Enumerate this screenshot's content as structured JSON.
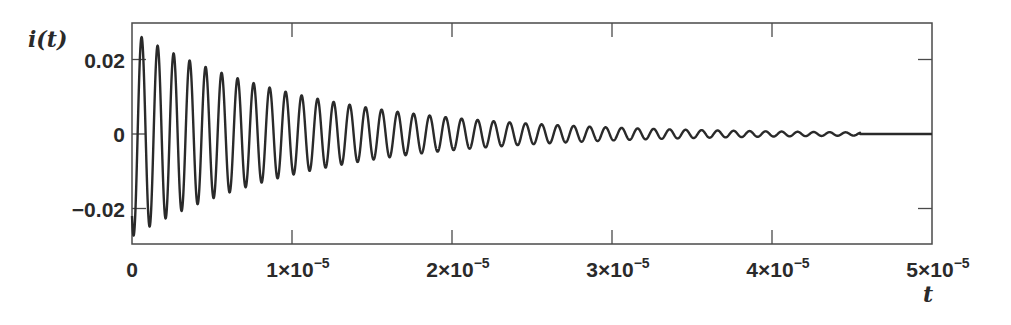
{
  "chart_data": {
    "type": "line",
    "title": "",
    "xlabel": "t",
    "ylabel": "i(t)",
    "xlim": [
      0,
      5e-05
    ],
    "ylim": [
      -0.03,
      0.03
    ],
    "grid": false,
    "legend": null,
    "x_ticks": [
      {
        "value": 0,
        "label": "0"
      },
      {
        "value": 1e-05,
        "label": "1×10",
        "exp": "−5"
      },
      {
        "value": 2e-05,
        "label": "2×10",
        "exp": "−5"
      },
      {
        "value": 3e-05,
        "label": "3×10",
        "exp": "−5"
      },
      {
        "value": 4e-05,
        "label": "4×10",
        "exp": "−5"
      },
      {
        "value": 5e-05,
        "label": "5×10",
        "exp": "−5"
      }
    ],
    "y_ticks": [
      {
        "value": 0.02,
        "label": "0.02"
      },
      {
        "value": 0,
        "label": "0"
      },
      {
        "value": -0.02,
        "label": "−0.02"
      }
    ],
    "series": [
      {
        "name": "i(t)",
        "description": "Underdamped decaying sinusoid (~1 MHz), amplitude decays from ~0.028 to ~0 by t≈4.55e-5, then flat at 0",
        "model": {
          "amplitude": 0.0275,
          "decay_rate": 92000,
          "frequency_hz": 1000000,
          "phase_rad": 2.5,
          "cutoff_t": 4.55e-05
        },
        "envelope_samples": {
          "t": [
            0,
            1e-05,
            2e-05,
            3e-05,
            4e-05,
            4.55e-05,
            5e-05
          ],
          "amplitude": [
            0.028,
            0.011,
            0.0046,
            0.0018,
            0.0007,
            0.0004,
            0
          ]
        },
        "color": "#2a2a2a"
      }
    ]
  }
}
